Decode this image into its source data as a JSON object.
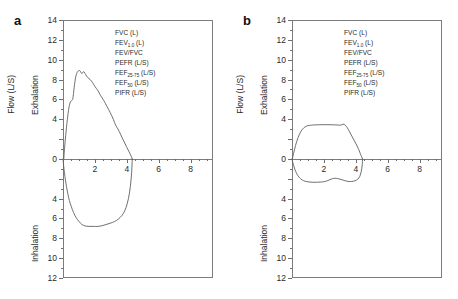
{
  "figure": {
    "panels": [
      {
        "letter": "a",
        "legend": [
          {
            "text": "FVC (L)",
            "base": "FVC (L)",
            "sub": ""
          },
          {
            "text": "FEV1.0 (L)",
            "base": "FEV",
            "sub": "1.0",
            "tail": " (L)"
          },
          {
            "text": "FEV/FVC",
            "base": "FEV/FVC",
            "sub": ""
          },
          {
            "text": "PEFR (L/S)",
            "base": "PEFR (L/S)",
            "sub": ""
          },
          {
            "text": "FEF25-75 (L/S)",
            "base": "FEF",
            "sub": "25-75",
            "tail": " (L/S)"
          },
          {
            "text": "FEF50 (L/S)",
            "base": "FEF",
            "sub": "50",
            "tail": " (L/S)"
          },
          {
            "text": "PIFR (L/S)",
            "base": "PIFR (L/S)",
            "sub": ""
          }
        ]
      },
      {
        "letter": "b",
        "legend": [
          {
            "text": "FVC (L)",
            "base": "FVC (L)",
            "sub": ""
          },
          {
            "text": "FEV1.0 (L)",
            "base": "FEV",
            "sub": "1.0",
            "tail": " (L)"
          },
          {
            "text": "FEV/FVC",
            "base": "FEV/FVC",
            "sub": ""
          },
          {
            "text": "PEFR (L/S)",
            "base": "PEFR (L/S)",
            "sub": ""
          },
          {
            "text": "FEF25-75 (L/S)",
            "base": "FEF",
            "sub": "25-75",
            "tail": " (L/S)"
          },
          {
            "text": "FEF50 (L/S)",
            "base": "FEF",
            "sub": "50",
            "tail": " (L/S)"
          },
          {
            "text": "PIFR (L/S)",
            "base": "PIFR (L/S)",
            "sub": ""
          }
        ]
      }
    ],
    "axis": {
      "ylabel": "Flow (L/S)",
      "label_exhalation": "Exhalation",
      "label_inhalation": "Inhalation",
      "yticks": [
        14,
        12,
        10,
        8,
        6,
        4,
        2,
        0,
        2,
        4,
        6,
        8,
        10,
        12
      ],
      "ytick_labels": [
        "14",
        "12",
        "10",
        "8",
        "6",
        "4",
        "",
        "0",
        "",
        "4",
        "6",
        "8",
        "10",
        "12"
      ],
      "xticks": [
        2,
        4,
        6,
        8
      ],
      "xtick_labels": [
        "2",
        "4",
        "6",
        "8"
      ],
      "xlim": [
        0,
        9.4
      ],
      "ylim_top": 14,
      "ylim_bottom": -12,
      "curve_color": "#5f5f5f",
      "frame_color": "#7c7c7c"
    }
  },
  "chart_data": [
    {
      "type": "line",
      "title": "a",
      "subtitle": "Normal flow-volume loop",
      "xlabel": "Volume (L)",
      "ylabel": "Flow (L/S)",
      "xlim": [
        0,
        9.4
      ],
      "ylim": [
        -12,
        14
      ],
      "grid": false,
      "legend": [
        "FVC (L)",
        "FEV1.0 (L)",
        "FEV/FVC",
        "PEFR (L/S)",
        "FEF25-75 (L/S)",
        "FEF50 (L/S)",
        "PIFR (L/S)"
      ],
      "series": [
        {
          "name": "Expiratory limb",
          "x": [
            0.05,
            0.12,
            0.22,
            0.32,
            0.4,
            0.48,
            0.55,
            0.62,
            0.7,
            0.8,
            0.92,
            1.05,
            1.18,
            1.3,
            1.42,
            1.55,
            1.7,
            1.85,
            2.0,
            2.18,
            2.35,
            2.55,
            2.75,
            2.95,
            3.15,
            3.3,
            3.45,
            3.6,
            3.75,
            3.9,
            4.05,
            4.18,
            4.28,
            4.34
          ],
          "y": [
            0.0,
            1.5,
            3.2,
            4.6,
            5.4,
            5.8,
            5.9,
            6.1,
            7.2,
            8.3,
            8.8,
            8.9,
            8.6,
            8.8,
            8.5,
            8.2,
            8.0,
            7.7,
            7.3,
            6.9,
            6.4,
            5.9,
            5.3,
            4.7,
            4.0,
            3.4,
            3.0,
            2.5,
            2.0,
            1.5,
            1.0,
            0.6,
            0.25,
            0.0
          ]
        },
        {
          "name": "Inspiratory limb",
          "x": [
            4.34,
            4.3,
            4.22,
            4.1,
            3.95,
            3.78,
            3.58,
            3.35,
            3.1,
            2.82,
            2.52,
            2.2,
            1.9,
            1.62,
            1.38,
            1.18,
            1.0,
            0.82,
            0.66,
            0.52,
            0.4,
            0.3,
            0.22,
            0.15,
            0.1,
            0.06,
            0.03,
            0.0
          ],
          "y": [
            0.0,
            -1.4,
            -2.8,
            -4.0,
            -4.9,
            -5.5,
            -5.9,
            -6.2,
            -6.4,
            -6.55,
            -6.7,
            -6.8,
            -6.8,
            -6.8,
            -6.75,
            -6.6,
            -6.3,
            -5.9,
            -5.4,
            -4.8,
            -4.2,
            -3.5,
            -2.8,
            -2.1,
            -1.5,
            -1.0,
            -0.5,
            0.0
          ]
        }
      ]
    },
    {
      "type": "line",
      "title": "b",
      "subtitle": "Flattened (box-shaped) flow-volume loop - fixed upper airway obstruction",
      "xlabel": "Volume (L)",
      "ylabel": "Flow (L/S)",
      "xlim": [
        0,
        9.4
      ],
      "ylim": [
        -12,
        14
      ],
      "grid": false,
      "legend": [
        "FVC (L)",
        "FEV1.0 (L)",
        "FEV/FVC",
        "PEFR (L/S)",
        "FEF25-75 (L/S)",
        "FEF50 (L/S)",
        "PIFR (L/S)"
      ],
      "series": [
        {
          "name": "Expiratory limb",
          "x": [
            0.02,
            0.1,
            0.22,
            0.38,
            0.55,
            0.72,
            0.9,
            1.1,
            1.35,
            1.65,
            1.95,
            2.25,
            2.55,
            2.85,
            3.05,
            3.2,
            3.32,
            3.42,
            3.52,
            3.62,
            3.75,
            3.9,
            4.05,
            4.18,
            4.28,
            4.36,
            4.42
          ],
          "y": [
            0.0,
            0.55,
            1.35,
            2.15,
            2.75,
            3.1,
            3.3,
            3.38,
            3.42,
            3.44,
            3.45,
            3.45,
            3.44,
            3.42,
            3.4,
            3.5,
            3.42,
            3.25,
            3.0,
            2.7,
            2.3,
            1.85,
            1.4,
            0.95,
            0.55,
            0.22,
            0.0
          ]
        },
        {
          "name": "Inspiratory limb",
          "x": [
            4.42,
            4.4,
            4.34,
            4.25,
            4.12,
            3.95,
            3.72,
            3.45,
            3.18,
            2.92,
            2.7,
            2.52,
            2.38,
            2.25,
            2.05,
            1.8,
            1.55,
            1.3,
            1.05,
            0.82,
            0.62,
            0.45,
            0.3,
            0.18,
            0.1,
            0.04,
            0.0
          ],
          "y": [
            0.0,
            -0.6,
            -1.25,
            -1.75,
            -2.05,
            -2.2,
            -2.28,
            -2.25,
            -2.12,
            -2.0,
            -1.95,
            -2.0,
            -2.08,
            -2.18,
            -2.28,
            -2.33,
            -2.35,
            -2.35,
            -2.32,
            -2.25,
            -2.1,
            -1.85,
            -1.5,
            -1.05,
            -0.65,
            -0.28,
            0.0
          ]
        }
      ]
    }
  ]
}
